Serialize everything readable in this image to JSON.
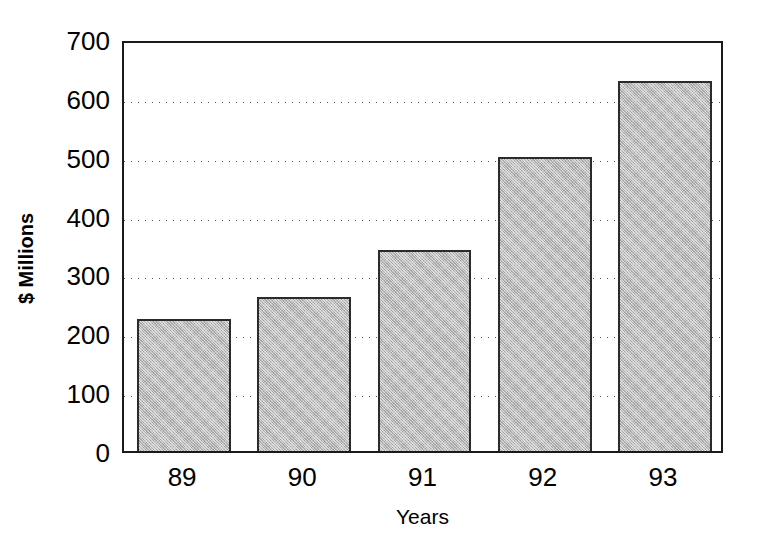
{
  "chart_data": {
    "type": "bar",
    "title": "",
    "categories": [
      "89",
      "90",
      "91",
      "92",
      "93"
    ],
    "values": [
      225,
      262,
      341,
      500,
      628
    ],
    "xlabel": "Years",
    "ylabel": "$ Millions",
    "ylim": [
      0,
      700
    ],
    "ytick_labels": [
      "0",
      "100",
      "200",
      "300",
      "400",
      "500",
      "600",
      "700"
    ],
    "ytick_values": [
      0,
      100,
      200,
      300,
      400,
      500,
      600,
      700
    ],
    "ystep": 100,
    "grid": "horizontal-dotted",
    "legend": "none",
    "series": [
      {
        "name": "Revenue",
        "values": [
          225,
          262,
          341,
          500,
          628
        ]
      }
    ],
    "colors": {
      "bar_fill": "#b9b9b9",
      "bar_border": "#2b2b2b",
      "axis": "#1a1a1a",
      "grid": "#555555",
      "background": "#ffffff",
      "text": "#000000"
    }
  }
}
